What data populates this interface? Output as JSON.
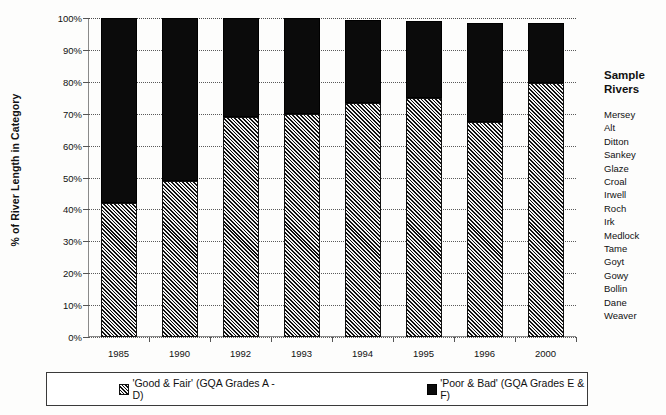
{
  "chart_data": {
    "type": "bar",
    "subtype": "stacked-bar-100",
    "title": "",
    "xlabel": "",
    "ylabel": "% of River Length in Category",
    "categories": [
      "1985",
      "1990",
      "1992",
      "1993",
      "1994",
      "1995",
      "1996",
      "2000"
    ],
    "series": [
      {
        "name": "'Good & Fair' (GQA Grades A - D)",
        "values": [
          42,
          49,
          69,
          70,
          73.5,
          75,
          67.5,
          79.5
        ],
        "fill": "hatched-diagonal",
        "color": "#8c8c8c"
      },
      {
        "name": "'Poor & Bad' (GQA Grades E & F)",
        "values": [
          58,
          51,
          31,
          30,
          26,
          24,
          31,
          19
        ],
        "fill": "solid",
        "color": "#0b0b0b"
      }
    ],
    "bar_totals": [
      100,
      100,
      100,
      100,
      99.5,
      99,
      98.5,
      98.5
    ],
    "ylim": [
      0,
      100
    ],
    "ytick_values": [
      0,
      10,
      20,
      30,
      40,
      50,
      60,
      70,
      80,
      90,
      100
    ],
    "ytick_labels": [
      "0%",
      "10%",
      "20%",
      "30%",
      "40%",
      "50%",
      "60%",
      "70%",
      "80%",
      "90%",
      "100%"
    ],
    "grid": "horizontal-dotted",
    "legend_position": "bottom"
  },
  "legend": {
    "items": [
      {
        "label": "'Good & Fair' (GQA Grades A - D)",
        "swatch": "hatch-swatch"
      },
      {
        "label": "'Poor & Bad' (GQA Grades E & F)",
        "swatch": "black-swatch"
      }
    ]
  },
  "side_panel": {
    "title_line1": "Sample",
    "title_line2": "Rivers",
    "rivers": [
      "Mersey",
      "Alt",
      "Ditton",
      "Sankey",
      "Glaze",
      "Croal",
      "Irwell",
      "Roch",
      "Irk",
      "Medlock",
      "Tame",
      "Goyt",
      "Gowy",
      "Bollin",
      "Dane",
      "Weaver"
    ]
  }
}
